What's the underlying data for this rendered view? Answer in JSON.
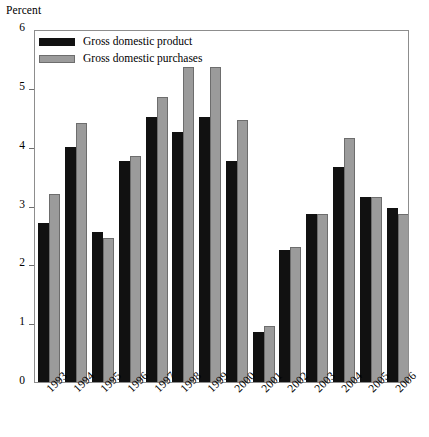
{
  "chart_data": {
    "type": "bar",
    "title": "",
    "xlabel": "",
    "ylabel": "Percent",
    "ylim": [
      0,
      6
    ],
    "yticks": [
      0,
      1,
      2,
      3,
      4,
      5,
      6
    ],
    "grid": false,
    "legend_position": "top-left",
    "categories": [
      "1993",
      "1994",
      "1995",
      "1996",
      "1997",
      "1998",
      "1999",
      "2000",
      "2001",
      "2002",
      "2003",
      "2004",
      "2005",
      "2006"
    ],
    "series": [
      {
        "name": "Gross domestic product",
        "color": "#111111",
        "values": [
          2.7,
          4.0,
          2.55,
          3.75,
          4.5,
          4.25,
          4.5,
          3.75,
          0.85,
          2.25,
          2.85,
          3.65,
          3.15,
          2.95
        ]
      },
      {
        "name": "Gross domestic purchases",
        "color": "#9b9b9b",
        "values": [
          3.2,
          4.4,
          2.45,
          3.85,
          4.85,
          5.35,
          5.35,
          4.45,
          0.95,
          2.3,
          2.85,
          4.15,
          3.15,
          2.85
        ]
      }
    ]
  },
  "axis": {
    "y_title": "Percent"
  },
  "legend": {
    "items": [
      {
        "label": "Gross domestic product",
        "swatch": "black-swatch"
      },
      {
        "label": "Gross domestic purchases",
        "swatch": "gray-swatch"
      }
    ]
  }
}
